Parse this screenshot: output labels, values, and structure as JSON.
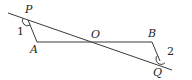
{
  "diagram": {
    "points": {
      "P": {
        "label": "P"
      },
      "A": {
        "label": "A"
      },
      "O": {
        "label": "O"
      },
      "B": {
        "label": "B"
      },
      "Q": {
        "label": "Q"
      }
    },
    "angles": {
      "angle1": {
        "label": "1"
      },
      "angle2": {
        "label": "2"
      }
    },
    "segments": [
      "PQ",
      "PA",
      "AB",
      "BQ"
    ],
    "colors": {
      "stroke": "#3a3a3a",
      "text": "#231f20",
      "background": "#ffffff"
    }
  }
}
